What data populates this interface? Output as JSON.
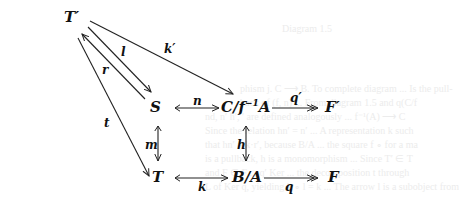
{
  "diagram": {
    "nodes": {
      "T_prime": "T′",
      "S": "S",
      "C_quot": "C/f",
      "C_quot_sup": "−1",
      "C_quot_tail": "A",
      "F_prime": "F′",
      "T": "T",
      "B_quot": "B/A",
      "F": "F"
    },
    "arrows": {
      "l": "l",
      "r": "r",
      "t": "t",
      "k_prime": "k′",
      "n": "n",
      "q_prime": "q′",
      "m": "m",
      "h": "h",
      "k": "k",
      "q": "q"
    }
  },
  "bleed_through": [
    "Diagram 1.5",
    "phism j. C ⟶ B. To complete diagram ... Is the pull-",
    "back of (f, n) ... From diagram 1.5 and q(C/f",
    "nd, n′ h′, ′ are defined analogously ... f⁻¹(A) ⟶ C",
    "Since the relation hn′ = n′ ... A representation k such",
    "that hn′ = k·r′, because B/A ... the square f ∘ for a ma",
    "is a pullback, h is a monomorphism ... Since T′ ∈ T",
    "and F ∈ F ... q′ Ker ... the decomposition t through",
    "L of Ker q, yielding k ∘ l = k ... The arrow l is a subobject from"
  ]
}
